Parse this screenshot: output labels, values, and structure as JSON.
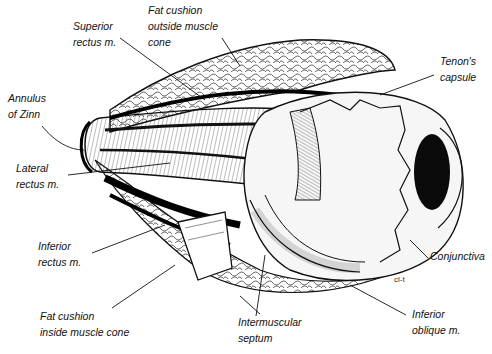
{
  "diagram": {
    "colors": {
      "ink": "#111111",
      "background": "#ffffff",
      "fill": "#f4f4f4"
    },
    "labels": [
      {
        "id": "superior-rectus",
        "lines": [
          "Superior",
          "rectus m."
        ],
        "x": 73,
        "y": 18
      },
      {
        "id": "fat-outside-cone",
        "lines": [
          "Fat cushion",
          "outside muscle",
          "cone"
        ],
        "x": 148,
        "y": 2
      },
      {
        "id": "tenons-capsule",
        "lines": [
          "Tenon's",
          "capsule"
        ],
        "x": 440,
        "y": 53
      },
      {
        "id": "annulus-of-zinn",
        "lines": [
          "Annulus",
          "of Zinn"
        ],
        "x": 8,
        "y": 90
      },
      {
        "id": "lateral-rectus",
        "lines": [
          "Lateral",
          "rectus m."
        ],
        "x": 16,
        "y": 160
      },
      {
        "id": "inferior-rectus",
        "lines": [
          "Inferior",
          "rectus m."
        ],
        "x": 38,
        "y": 238
      },
      {
        "id": "conjunctiva",
        "lines": [
          "Conjunctiva"
        ],
        "x": 430,
        "y": 248
      },
      {
        "id": "fat-inside-cone",
        "lines": [
          "Fat cushion",
          "inside muscle cone"
        ],
        "x": 40,
        "y": 308
      },
      {
        "id": "intermuscular-septum",
        "lines": [
          "Intermuscular",
          "septum"
        ],
        "x": 238,
        "y": 314
      },
      {
        "id": "inferior-oblique",
        "lines": [
          "Inferior",
          "oblique m."
        ],
        "x": 412,
        "y": 306
      }
    ],
    "signature": "cl-t"
  }
}
